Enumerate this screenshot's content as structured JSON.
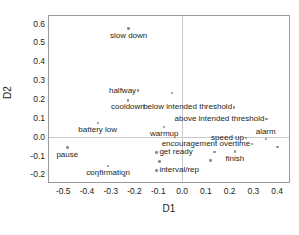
{
  "chart_data": {
    "type": "scatter",
    "title": "",
    "xlabel": "D1",
    "ylabel": "D2",
    "xlim": [
      -0.56,
      0.45
    ],
    "ylim": [
      -0.24,
      0.64
    ],
    "grid": false,
    "legend": "none",
    "xticks": [
      "-0.5",
      "-0.4",
      "-0.3",
      "-0.2",
      "-0.1",
      "0.0",
      "0.1",
      "0.2",
      "0.3",
      "0.4"
    ],
    "xtick_values": [
      -0.5,
      -0.4,
      -0.3,
      -0.2,
      -0.1,
      0.0,
      0.1,
      0.2,
      0.3,
      0.4
    ],
    "yticks": [
      "0.6",
      "0.5",
      "0.4",
      "0.3",
      "0.2",
      "0.1",
      "0.0",
      "-0.1",
      "-0.2"
    ],
    "ytick_values": [
      0.6,
      0.5,
      0.4,
      0.3,
      0.2,
      0.1,
      0.0,
      -0.1,
      -0.2
    ],
    "marker_color": "#8c8c8c",
    "frame_color": "#9a9a9a",
    "points": [
      {
        "label": "slow down",
        "x": -0.225,
        "y": 0.573,
        "label_pos": "below"
      },
      {
        "label": "halfway",
        "x": -0.185,
        "y": 0.245,
        "label_pos": "right"
      },
      {
        "label": "",
        "x": -0.043,
        "y": 0.231,
        "label_pos": "none"
      },
      {
        "label": "cooldown",
        "x": -0.228,
        "y": 0.193,
        "label_pos": "below"
      },
      {
        "label": "below intended threshold",
        "x": 0.219,
        "y": 0.156,
        "label_pos": "right"
      },
      {
        "label": "above intended threshold",
        "x": 0.355,
        "y": 0.095,
        "label_pos": "right"
      },
      {
        "label": "battery low",
        "x": -0.355,
        "y": 0.072,
        "label_pos": "below"
      },
      {
        "label": "warmup",
        "x": -0.075,
        "y": 0.051,
        "label_pos": "below"
      },
      {
        "label": "alarm",
        "x": 0.352,
        "y": -0.012,
        "label_pos": "above"
      },
      {
        "label": "speed up",
        "x": 0.269,
        "y": -0.006,
        "label_pos": "right"
      },
      {
        "label": "encouragement overtime",
        "x": 0.295,
        "y": -0.039,
        "label_pos": "right"
      },
      {
        "label": "",
        "x": 0.402,
        "y": -0.053,
        "label_pos": "none"
      },
      {
        "label": "pause",
        "x": -0.483,
        "y": -0.058,
        "label_pos": "below"
      },
      {
        "label": "get ready",
        "x": -0.108,
        "y": -0.083,
        "label_pos": "left"
      },
      {
        "label": "",
        "x": 0.136,
        "y": -0.081,
        "label_pos": "none"
      },
      {
        "label": "finish",
        "x": 0.222,
        "y": -0.079,
        "label_pos": "below"
      },
      {
        "label": "",
        "x": -0.095,
        "y": -0.132,
        "label_pos": "none"
      },
      {
        "label": "",
        "x": 0.119,
        "y": -0.126,
        "label_pos": "none"
      },
      {
        "label": "confirmation",
        "x": -0.311,
        "y": -0.155,
        "label_pos": "below"
      },
      {
        "label": "interval/rep",
        "x": -0.108,
        "y": -0.178,
        "label_pos": "left"
      },
      {
        "label": "",
        "x": -0.383,
        "y": -0.19,
        "label_pos": "none"
      },
      {
        "label": "",
        "x": -0.355,
        "y": -0.208,
        "label_pos": "none"
      },
      {
        "label": "",
        "x": -0.242,
        "y": -0.207,
        "label_pos": "none"
      }
    ]
  }
}
